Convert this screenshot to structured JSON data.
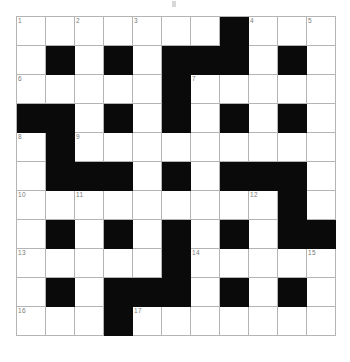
{
  "puzzle": {
    "type": "crossword-grid",
    "title": "",
    "columns": 11,
    "rows": 11,
    "cell_size_px": 29,
    "grid_origin_px": {
      "x": 16,
      "y": 16
    },
    "colors": {
      "background": "#ffffff",
      "block": "#0a0a0a",
      "grid_line": "#b4b4b4",
      "clue_number": "#7a7a7a"
    },
    "legend": {
      "open_cell": "white fillable square",
      "block_cell": "black blocked square"
    },
    "max_clue_number": 17,
    "clue_numbers_present": [
      1,
      2,
      3,
      4,
      5,
      6,
      7,
      8,
      9,
      10,
      11,
      12,
      13,
      14,
      15,
      16,
      17
    ],
    "pattern_note": "1 = open white cell, 0 = black blocked cell. Rows listed top to bottom, columns left to right.",
    "grid": [
      [
        1,
        1,
        1,
        1,
        1,
        1,
        1,
        0,
        1,
        1,
        1
      ],
      [
        1,
        0,
        1,
        0,
        1,
        0,
        0,
        0,
        1,
        0,
        1
      ],
      [
        1,
        1,
        1,
        1,
        1,
        0,
        1,
        1,
        1,
        1,
        1
      ],
      [
        0,
        0,
        1,
        0,
        1,
        0,
        1,
        0,
        1,
        0,
        1
      ],
      [
        1,
        0,
        1,
        1,
        1,
        1,
        1,
        1,
        1,
        1,
        1
      ],
      [
        1,
        0,
        0,
        0,
        1,
        0,
        1,
        0,
        0,
        0,
        1
      ],
      [
        1,
        1,
        1,
        1,
        1,
        1,
        1,
        1,
        1,
        0,
        1
      ],
      [
        1,
        0,
        1,
        0,
        1,
        0,
        1,
        0,
        1,
        0,
        0
      ],
      [
        1,
        1,
        1,
        1,
        1,
        0,
        1,
        1,
        1,
        1,
        1
      ],
      [
        1,
        0,
        1,
        0,
        0,
        0,
        1,
        0,
        1,
        0,
        1
      ],
      [
        1,
        1,
        1,
        0,
        1,
        1,
        1,
        1,
        1,
        1,
        1
      ]
    ],
    "numbers": [
      {
        "number": 1,
        "row": 1,
        "col": 1
      },
      {
        "number": 2,
        "row": 1,
        "col": 3
      },
      {
        "number": 3,
        "row": 1,
        "col": 5
      },
      {
        "number": 4,
        "row": 1,
        "col": 9
      },
      {
        "number": 5,
        "row": 1,
        "col": 11
      },
      {
        "number": 6,
        "row": 3,
        "col": 1
      },
      {
        "number": 7,
        "row": 3,
        "col": 7
      },
      {
        "number": 8,
        "row": 5,
        "col": 1
      },
      {
        "number": 9,
        "row": 5,
        "col": 3
      },
      {
        "number": 10,
        "row": 7,
        "col": 1
      },
      {
        "number": 11,
        "row": 7,
        "col": 3
      },
      {
        "number": 12,
        "row": 7,
        "col": 9
      },
      {
        "number": 13,
        "row": 9,
        "col": 1
      },
      {
        "number": 14,
        "row": 9,
        "col": 7
      },
      {
        "number": 15,
        "row": 9,
        "col": 11
      },
      {
        "number": 16,
        "row": 11,
        "col": 1
      },
      {
        "number": 17,
        "row": 11,
        "col": 5
      }
    ],
    "letters": []
  }
}
